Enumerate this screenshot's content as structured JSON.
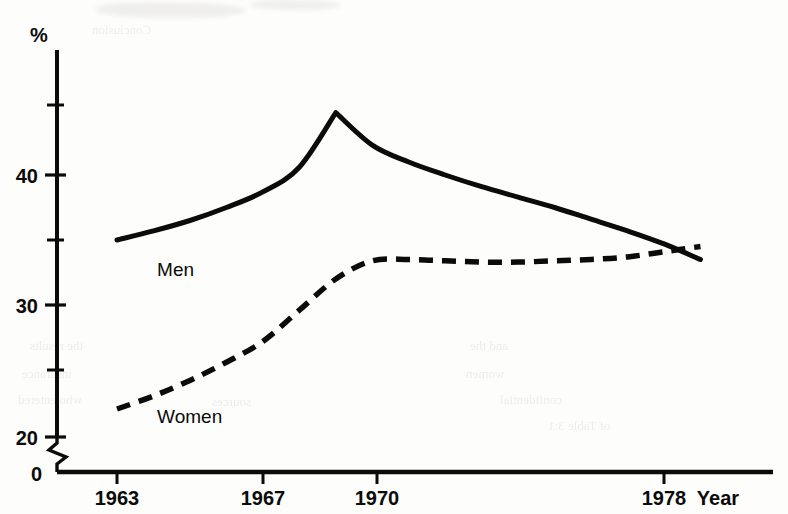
{
  "chart_data": {
    "type": "line",
    "title": "",
    "xlabel": "Year",
    "ylabel": "%",
    "xlim": [
      1963,
      1979
    ],
    "ylim": [
      20,
      46.5
    ],
    "yaxis_break": true,
    "yaxis_break_from": 0,
    "yaxis_break_to": 20,
    "grid": false,
    "legend": "inline-labels",
    "x_tick_labels": [
      "1963",
      "1967",
      "1970",
      "1978"
    ],
    "x_tick_values": [
      1963,
      1967,
      1970,
      1978
    ],
    "y_tick_labels": [
      "0",
      "20",
      "30",
      "40"
    ],
    "y_tick_values": [
      0,
      20,
      30,
      40
    ],
    "y_minor_tick_values": [
      25,
      35,
      45
    ],
    "series": [
      {
        "name": "Men",
        "style": "solid",
        "color": "#0b0b0b",
        "label_x": 1964.1,
        "label_y": 32.2,
        "x": [
          1963,
          1964,
          1965,
          1966,
          1967,
          1968,
          1969.0,
          1970,
          1971,
          1972,
          1973,
          1974,
          1975,
          1976,
          1977,
          1978,
          1979
        ],
        "y": [
          35.0,
          35.7,
          36.5,
          37.5,
          38.7,
          40.6,
          44.8,
          42.3,
          41.0,
          40.0,
          39.1,
          38.3,
          37.5,
          36.6,
          35.7,
          34.7,
          33.5
        ]
      },
      {
        "name": "Women",
        "style": "dashed",
        "color": "#0b0b0b",
        "label_x": 1964.1,
        "label_y": 20.9,
        "x": [
          1963,
          1964,
          1965,
          1966,
          1967,
          1968,
          1969,
          1970,
          1971,
          1972,
          1973,
          1974,
          1975,
          1976,
          1977,
          1978,
          1979
        ],
        "y": [
          22.0,
          23.0,
          24.2,
          25.6,
          27.2,
          29.6,
          32.0,
          33.4,
          33.5,
          33.4,
          33.3,
          33.3,
          33.4,
          33.5,
          33.7,
          34.1,
          34.5
        ]
      }
    ],
    "annotations": [
      {
        "name": "percent-symbol",
        "text": "%"
      },
      {
        "name": "year-axis-title",
        "text": "Year"
      }
    ]
  },
  "background_bleed": [
    {
      "text": "Conclusion",
      "x": 92,
      "y": 22,
      "size": 13
    },
    {
      "text": "and the",
      "x": 470,
      "y": 338,
      "size": 13
    },
    {
      "text": "women",
      "x": 466,
      "y": 366,
      "size": 13
    },
    {
      "text": "confidential",
      "x": 500,
      "y": 392,
      "size": 13
    },
    {
      "text": "of Table 3:1",
      "x": 548,
      "y": 418,
      "size": 13
    },
    {
      "text": "the results",
      "x": 30,
      "y": 338,
      "size": 13
    },
    {
      "text": "insurance",
      "x": 22,
      "y": 366,
      "size": 13
    },
    {
      "text": "who entered",
      "x": 18,
      "y": 392,
      "size": 13
    },
    {
      "text": "sources",
      "x": 212,
      "y": 394,
      "size": 13
    }
  ]
}
